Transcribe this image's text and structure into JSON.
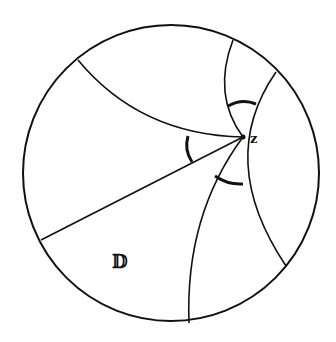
{
  "diagram": {
    "disk_label": "𝔻",
    "point_label": "z",
    "colors": {
      "stroke": "#111111",
      "background": "#ffffff"
    },
    "disk": {
      "cx": 171,
      "cy": 173,
      "r": 148
    },
    "point": {
      "x": 243,
      "y": 137
    },
    "geodesics": [
      {
        "name": "upper-left-arc",
        "from": [
          78,
          60
        ],
        "to": [
          243,
          137
        ]
      },
      {
        "name": "diameter-segment",
        "from": [
          243,
          137
        ],
        "to": [
          41,
          240
        ]
      },
      {
        "name": "lower-arc",
        "from": [
          243,
          137
        ],
        "to": [
          189,
          323
        ]
      },
      {
        "name": "top-small-arc",
        "from": [
          233,
          40
        ],
        "to": [
          243,
          137
        ]
      },
      {
        "name": "right-arc",
        "from": [
          276,
          72
        ],
        "to": [
          286,
          266
        ]
      }
    ],
    "angle_marks": 3
  }
}
